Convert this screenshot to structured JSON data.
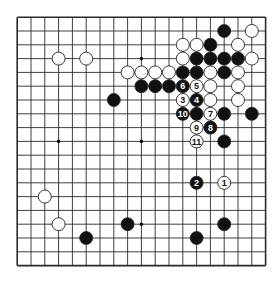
{
  "diagram": {
    "type": "go-board",
    "board_size": 19,
    "colors": {
      "background": "#ffffff",
      "grid_line": "#2a2a2a",
      "black_stone": "#111111",
      "white_stone": "#ffffff",
      "stone_outline": "#222222",
      "hoshi": "#111111"
    },
    "hoshi_visible": [
      [
        9,
        3
      ],
      [
        3,
        9
      ],
      [
        9,
        9
      ],
      [
        9,
        15
      ]
    ],
    "black_stones": [
      [
        15,
        1
      ],
      [
        14,
        2
      ],
      [
        13,
        3
      ],
      [
        14,
        3
      ],
      [
        15,
        3
      ],
      [
        16,
        3
      ],
      [
        12,
        4
      ],
      [
        13,
        4
      ],
      [
        15,
        4
      ],
      [
        9,
        5
      ],
      [
        10,
        5
      ],
      [
        11,
        5
      ],
      [
        7,
        6
      ],
      [
        13,
        7
      ],
      [
        15,
        7
      ],
      [
        17,
        7
      ],
      [
        15,
        9
      ],
      [
        8,
        15
      ],
      [
        15,
        15
      ],
      [
        5,
        16
      ],
      [
        13,
        16
      ]
    ],
    "white_stones": [
      [
        17,
        1
      ],
      [
        12,
        2
      ],
      [
        13,
        2
      ],
      [
        16,
        2
      ],
      [
        3,
        3
      ],
      [
        5,
        3
      ],
      [
        12,
        3
      ],
      [
        17,
        3
      ],
      [
        8,
        4
      ],
      [
        9,
        4
      ],
      [
        10,
        4
      ],
      [
        11,
        4
      ],
      [
        14,
        4
      ],
      [
        16,
        4
      ],
      [
        14,
        5
      ],
      [
        16,
        5
      ],
      [
        14,
        6
      ],
      [
        16,
        6
      ],
      [
        2,
        13
      ],
      [
        3,
        15
      ]
    ],
    "numbered_moves": [
      {
        "n": "1",
        "color": "white",
        "x": 15,
        "y": 12
      },
      {
        "n": "2",
        "color": "black",
        "x": 13,
        "y": 12
      },
      {
        "n": "3",
        "color": "white",
        "x": 12,
        "y": 6
      },
      {
        "n": "4",
        "color": "black",
        "x": 13,
        "y": 6
      },
      {
        "n": "5",
        "color": "white",
        "x": 13,
        "y": 5
      },
      {
        "n": "6",
        "color": "black",
        "x": 12,
        "y": 5
      },
      {
        "n": "7",
        "color": "white",
        "x": 14,
        "y": 7
      },
      {
        "n": "8",
        "color": "black",
        "x": 14,
        "y": 8
      },
      {
        "n": "9",
        "color": "white",
        "x": 13,
        "y": 8
      },
      {
        "n": "10",
        "color": "black",
        "x": 12,
        "y": 7
      },
      {
        "n": "11",
        "color": "white",
        "x": 13,
        "y": 9
      }
    ]
  }
}
